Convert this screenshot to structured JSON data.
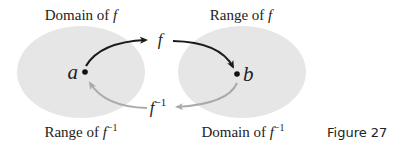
{
  "labels": {
    "domain_of_f": "Domain of ",
    "range_of_f": "Range of ",
    "range_of_finv": "Range of ",
    "domain_of_finv": "Domain of ",
    "f": "f",
    "inv_exp": "−1",
    "point_a": "a",
    "point_b": "b"
  },
  "caption": "Figure 27",
  "colors": {
    "ellipse_fill": "#e6e6e6",
    "forward_arrow": "#1a1a1a",
    "inverse_arrow": "#aaaaaa",
    "text": "#222222"
  }
}
